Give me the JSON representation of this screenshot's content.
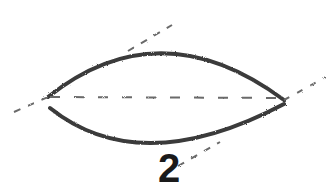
{
  "figure": {
    "label": "2",
    "colors": {
      "stroke": "#3a3a3a",
      "dash": "#6a6a6a",
      "background": "#ffffff"
    },
    "shapes": {
      "lens": {
        "left_tip": [
          48,
          97
        ],
        "right_tip": [
          284,
          100
        ],
        "top_control": [
          160,
          10
        ],
        "bottom_control": [
          165,
          190
        ]
      },
      "axis": {
        "from": [
          50,
          97
        ],
        "to": [
          282,
          98
        ]
      },
      "tangent_lines": [
        {
          "segments": [
            [
              [
                14,
                112
              ],
              [
                48,
                97
              ]
            ],
            [
              [
                128,
                51
              ],
              [
                172,
                25
              ]
            ]
          ]
        },
        {
          "segments": [
            [
              [
                284,
                100
              ],
              [
                326,
                77
              ]
            ],
            [
              [
                178,
                166
              ],
              [
                220,
                142
              ]
            ]
          ]
        }
      ]
    }
  }
}
